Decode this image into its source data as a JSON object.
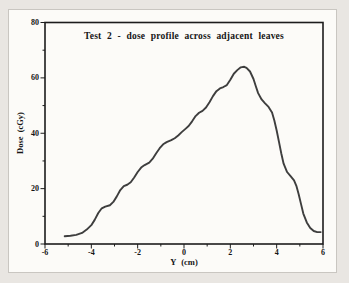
{
  "colors": {
    "page_background": "#e9e6e2",
    "panel_background": "#fcfbf8",
    "panel_border": "#c9c6c1",
    "axis": "#1c1c1c",
    "curve": "#3e3e3e",
    "text": "#151515"
  },
  "chart_data": {
    "type": "line",
    "title": "Test 2 - dose profile across adjacent leaves",
    "xlabel": "Y (cm)",
    "ylabel": "Dose (cGy)",
    "xlim": [
      -6,
      6
    ],
    "ylim": [
      0,
      80
    ],
    "x_major_ticks": [
      -6,
      -4,
      -2,
      0,
      2,
      4,
      6
    ],
    "x_minor_tick_step": 1,
    "y_major_ticks": [
      0,
      20,
      40,
      60,
      80
    ],
    "y_minor_tick_step": 10,
    "grid": false,
    "legend": "none",
    "series": [
      {
        "name": "dose profile",
        "points": [
          [
            -5.15,
            2.8
          ],
          [
            -4.9,
            3.0
          ],
          [
            -4.65,
            3.3
          ],
          [
            -4.4,
            4.0
          ],
          [
            -4.2,
            5.2
          ],
          [
            -4.0,
            6.8
          ],
          [
            -3.85,
            8.8
          ],
          [
            -3.7,
            11.2
          ],
          [
            -3.55,
            12.9
          ],
          [
            -3.4,
            13.5
          ],
          [
            -3.2,
            14.0
          ],
          [
            -3.05,
            15.2
          ],
          [
            -2.9,
            17.2
          ],
          [
            -2.75,
            19.5
          ],
          [
            -2.6,
            20.9
          ],
          [
            -2.45,
            21.4
          ],
          [
            -2.3,
            22.3
          ],
          [
            -2.15,
            24.0
          ],
          [
            -2.0,
            26.0
          ],
          [
            -1.85,
            27.6
          ],
          [
            -1.7,
            28.5
          ],
          [
            -1.5,
            29.4
          ],
          [
            -1.35,
            30.8
          ],
          [
            -1.2,
            32.8
          ],
          [
            -1.05,
            34.6
          ],
          [
            -0.9,
            36.0
          ],
          [
            -0.75,
            36.8
          ],
          [
            -0.55,
            37.5
          ],
          [
            -0.4,
            38.2
          ],
          [
            -0.25,
            39.2
          ],
          [
            -0.1,
            40.4
          ],
          [
            0.05,
            41.5
          ],
          [
            0.2,
            42.6
          ],
          [
            0.35,
            44.3
          ],
          [
            0.5,
            46.2
          ],
          [
            0.65,
            47.4
          ],
          [
            0.8,
            48.1
          ],
          [
            0.95,
            49.3
          ],
          [
            1.1,
            51.2
          ],
          [
            1.25,
            53.4
          ],
          [
            1.4,
            55.2
          ],
          [
            1.55,
            56.2
          ],
          [
            1.7,
            56.7
          ],
          [
            1.85,
            57.4
          ],
          [
            2.0,
            59.3
          ],
          [
            2.15,
            61.5
          ],
          [
            2.3,
            62.8
          ],
          [
            2.45,
            63.8
          ],
          [
            2.6,
            64.0
          ],
          [
            2.7,
            63.6
          ],
          [
            2.85,
            62.3
          ],
          [
            3.0,
            59.6
          ],
          [
            3.1,
            57.0
          ],
          [
            3.2,
            54.5
          ],
          [
            3.35,
            52.2
          ],
          [
            3.5,
            50.8
          ],
          [
            3.65,
            49.5
          ],
          [
            3.8,
            47.5
          ],
          [
            3.9,
            44.6
          ],
          [
            4.0,
            41.0
          ],
          [
            4.1,
            36.9
          ],
          [
            4.2,
            32.7
          ],
          [
            4.3,
            29.0
          ],
          [
            4.45,
            26.0
          ],
          [
            4.6,
            24.5
          ],
          [
            4.75,
            23.0
          ],
          [
            4.85,
            21.0
          ],
          [
            4.95,
            18.0
          ],
          [
            5.05,
            14.5
          ],
          [
            5.15,
            11.0
          ],
          [
            5.3,
            7.8
          ],
          [
            5.45,
            5.8
          ],
          [
            5.6,
            4.7
          ],
          [
            5.75,
            4.3
          ],
          [
            5.9,
            4.3
          ]
        ]
      }
    ]
  }
}
